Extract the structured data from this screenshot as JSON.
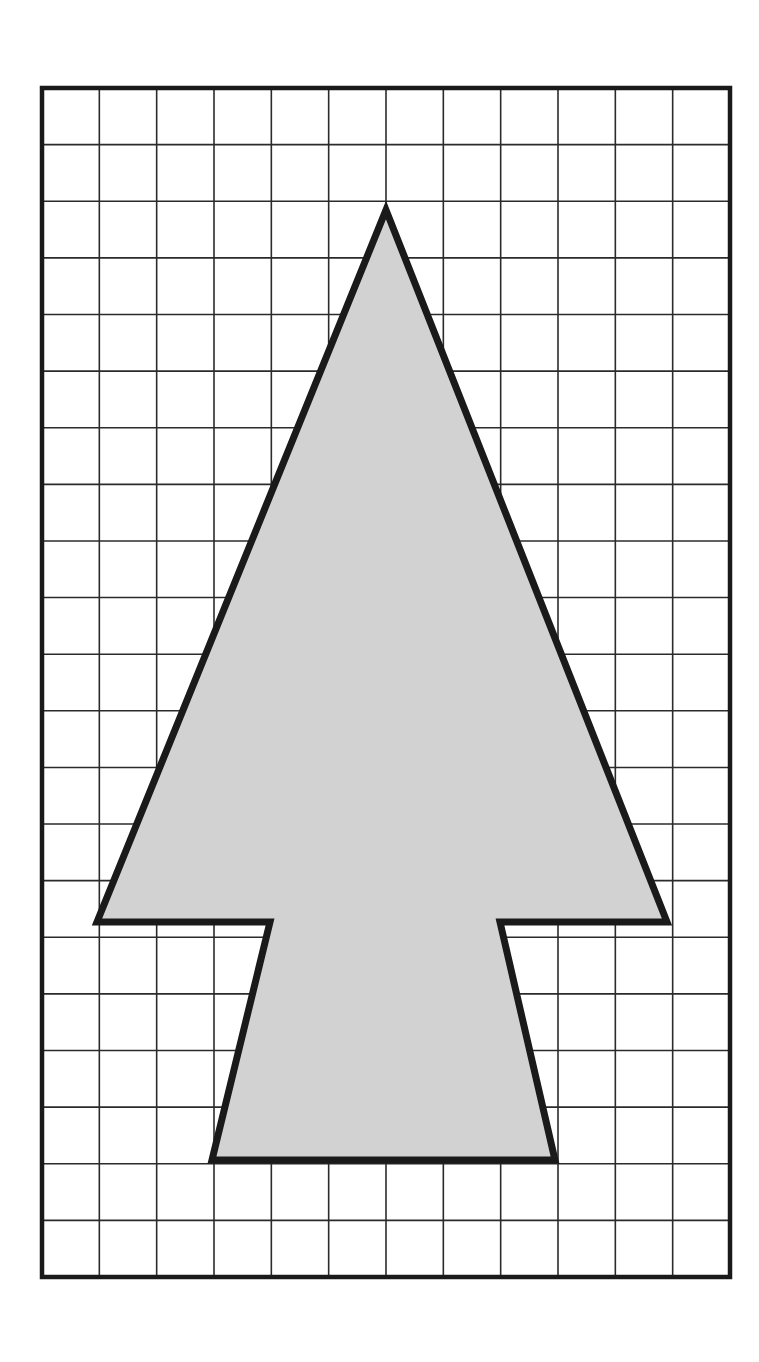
{
  "figure": {
    "background_color": "#ffffff",
    "canvas": {
      "width": 759,
      "height": 1362
    }
  },
  "grid": {
    "name": "square-grid",
    "columns": 12,
    "rows": 21,
    "left": 42,
    "top": 88,
    "right": 730,
    "bottom": 1277,
    "cell_width": 57.33,
    "cell_height": 56.62,
    "inner_line_color": "#2b2b2b",
    "inner_line_width": 1.6,
    "border_color": "#1a1a1a",
    "border_width": 4.5
  },
  "shape": {
    "name": "arrow-polygon",
    "label": "Arrow / tree shape",
    "fill_color": "#d2d2d2",
    "stroke_color": "#1a1a1a",
    "stroke_width": 7,
    "vertices": [
      {
        "name": "apex",
        "x": 386,
        "y": 210
      },
      {
        "name": "right-slope-to-wing",
        "x": 667,
        "y": 922
      },
      {
        "name": "right-wing-tip",
        "x": 667,
        "y": 922
      },
      {
        "name": "stem-top-right",
        "x": 500,
        "y": 922
      },
      {
        "name": "stem-bottom-right",
        "x": 555,
        "y": 1160
      },
      {
        "name": "stem-bottom-left",
        "x": 212,
        "y": 1160
      },
      {
        "name": "stem-top-left",
        "x": 270,
        "y": 922
      },
      {
        "name": "left-wing-tip",
        "x": 97,
        "y": 922
      }
    ],
    "path_points": "386,210 667,922 500,922 555,1160 212,1160 270,922 97,922"
  },
  "chart_data": {
    "type": "scatter",
    "xlabel": "grid columns",
    "ylabel": "grid rows",
    "xlim": [
      0,
      12
    ],
    "ylim": [
      0,
      21
    ],
    "grid": true,
    "legend": "none",
    "annotations": [
      "Grid cell size is uniform (approximately 57 x 57 px)",
      "Polygon is filled light gray with a thick black outline",
      "Apex sits on a grid intersection at column 6, row 2 from the top",
      "Horizontal shoulder line lies on the grid line 14.7 rows from the top"
    ],
    "series": [
      {
        "name": "arrow-polygon-vertices",
        "closed": true,
        "x": [
          6.0,
          10.9,
          8.0,
          8.95,
          2.96,
          3.98,
          0.96
        ],
        "y": [
          2.15,
          14.73,
          14.73,
          18.93,
          18.93,
          14.73,
          14.73
        ]
      }
    ]
  }
}
